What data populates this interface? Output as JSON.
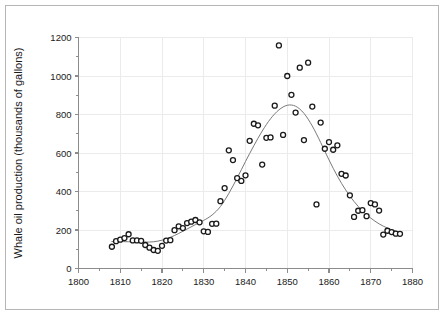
{
  "chart_data": {
    "type": "scatter",
    "title": "",
    "xlabel": "",
    "ylabel": "Whale oil production (thousands of gallons)",
    "xlim": [
      1800,
      1880
    ],
    "ylim": [
      0,
      1200
    ],
    "x_ticks": [
      1800,
      1810,
      1820,
      1830,
      1840,
      1850,
      1860,
      1870,
      1880
    ],
    "x_tick_labels": [
      "1800",
      "1810",
      "1820",
      "1830",
      "1840",
      "1850",
      "1860",
      "1870",
      "1880"
    ],
    "x_minor_step": 5,
    "y_ticks": [
      0,
      200,
      400,
      600,
      800,
      1000,
      1200
    ],
    "y_tick_labels": [
      "0",
      "200",
      "400",
      "600",
      "800",
      "1000",
      "1200"
    ],
    "y_minor_step": 100,
    "grid": true,
    "legend": false,
    "marker": "open-circle",
    "marker_color": "#1a1a1a",
    "grid_color": "#ebebeb",
    "axis_color": "#8c8c8c",
    "trend_color": "#7a7a7a",
    "series": [
      {
        "name": "Whale oil production",
        "points": [
          [
            1808,
            113
          ],
          [
            1809,
            142
          ],
          [
            1810,
            150
          ],
          [
            1811,
            158
          ],
          [
            1812,
            178
          ],
          [
            1813,
            146
          ],
          [
            1814,
            146
          ],
          [
            1815,
            144
          ],
          [
            1816,
            122
          ],
          [
            1817,
            108
          ],
          [
            1818,
            96
          ],
          [
            1819,
            92
          ],
          [
            1820,
            118
          ],
          [
            1821,
            145
          ],
          [
            1822,
            147
          ],
          [
            1823,
            199
          ],
          [
            1824,
            219
          ],
          [
            1825,
            210
          ],
          [
            1826,
            236
          ],
          [
            1827,
            243
          ],
          [
            1828,
            252
          ],
          [
            1829,
            240
          ],
          [
            1830,
            193
          ],
          [
            1831,
            190
          ],
          [
            1832,
            232
          ],
          [
            1833,
            233
          ],
          [
            1834,
            350
          ],
          [
            1835,
            418
          ],
          [
            1836,
            614
          ],
          [
            1837,
            563
          ],
          [
            1838,
            470
          ],
          [
            1839,
            455
          ],
          [
            1840,
            484
          ],
          [
            1841,
            663
          ],
          [
            1842,
            752
          ],
          [
            1843,
            744
          ],
          [
            1844,
            540
          ],
          [
            1845,
            679
          ],
          [
            1846,
            681
          ],
          [
            1847,
            846
          ],
          [
            1848,
            1159
          ],
          [
            1849,
            694
          ],
          [
            1850,
            1000
          ],
          [
            1851,
            902
          ],
          [
            1852,
            810
          ],
          [
            1853,
            1043
          ],
          [
            1854,
            667
          ],
          [
            1855,
            1069
          ],
          [
            1856,
            841
          ],
          [
            1857,
            333
          ],
          [
            1858,
            758
          ],
          [
            1859,
            622
          ],
          [
            1860,
            657
          ],
          [
            1861,
            617
          ],
          [
            1862,
            640
          ],
          [
            1863,
            492
          ],
          [
            1864,
            483
          ],
          [
            1865,
            380
          ],
          [
            1866,
            268
          ],
          [
            1867,
            300
          ],
          [
            1868,
            303
          ],
          [
            1869,
            272
          ],
          [
            1870,
            340
          ],
          [
            1871,
            333
          ],
          [
            1872,
            301
          ],
          [
            1873,
            176
          ],
          [
            1874,
            196
          ],
          [
            1875,
            189
          ],
          [
            1876,
            181
          ],
          [
            1877,
            180
          ]
        ]
      }
    ],
    "trend_line": {
      "name": "smoothed trend",
      "points": [
        [
          1808,
          140
        ],
        [
          1810,
          140
        ],
        [
          1812,
          139
        ],
        [
          1814,
          137
        ],
        [
          1816,
          137
        ],
        [
          1818,
          139
        ],
        [
          1820,
          147
        ],
        [
          1822,
          162
        ],
        [
          1824,
          182
        ],
        [
          1826,
          205
        ],
        [
          1828,
          228
        ],
        [
          1830,
          250
        ],
        [
          1832,
          278
        ],
        [
          1834,
          322
        ],
        [
          1836,
          390
        ],
        [
          1838,
          470
        ],
        [
          1840,
          556
        ],
        [
          1842,
          638
        ],
        [
          1844,
          714
        ],
        [
          1846,
          778
        ],
        [
          1848,
          824
        ],
        [
          1850,
          848
        ],
        [
          1852,
          843
        ],
        [
          1854,
          806
        ],
        [
          1856,
          740
        ],
        [
          1858,
          655
        ],
        [
          1860,
          564
        ],
        [
          1862,
          480
        ],
        [
          1864,
          408
        ],
        [
          1866,
          348
        ],
        [
          1868,
          300
        ],
        [
          1870,
          262
        ],
        [
          1872,
          232
        ],
        [
          1874,
          210
        ],
        [
          1876,
          194
        ],
        [
          1877,
          188
        ]
      ]
    }
  }
}
